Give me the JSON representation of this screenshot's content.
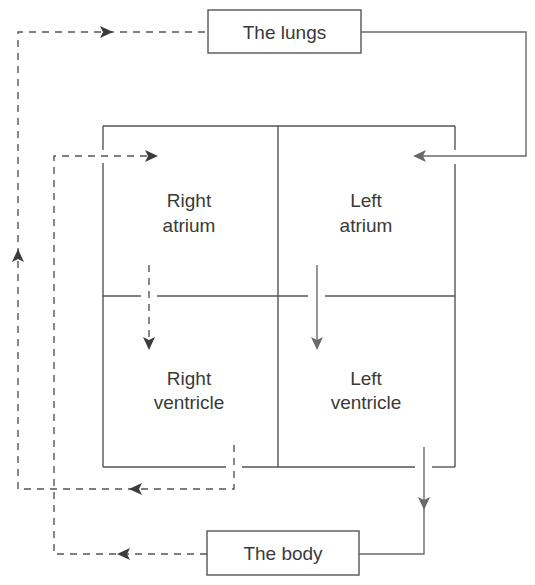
{
  "diagram": {
    "title": "",
    "nodes": {
      "lungs": {
        "label": "The lungs"
      },
      "body": {
        "label": "The body"
      },
      "right_atrium": {
        "line1": "Right",
        "line2": "atrium"
      },
      "left_atrium": {
        "line1": "Left",
        "line2": "atrium"
      },
      "right_ventricle": {
        "line1": "Right",
        "line2": "ventricle"
      },
      "left_ventricle": {
        "line1": "Left",
        "line2": "ventricle"
      }
    },
    "edges": [
      {
        "from": "body",
        "to": "right_atrium",
        "style": "dashed",
        "meaning": "deoxygenated blood"
      },
      {
        "from": "right_atrium",
        "to": "right_ventricle",
        "style": "dashed"
      },
      {
        "from": "right_ventricle",
        "to": "lungs",
        "style": "dashed"
      },
      {
        "from": "lungs",
        "to": "left_atrium",
        "style": "solid",
        "meaning": "oxygenated blood"
      },
      {
        "from": "left_atrium",
        "to": "left_ventricle",
        "style": "solid"
      },
      {
        "from": "left_ventricle",
        "to": "body",
        "style": "solid"
      }
    ],
    "colors": {
      "stroke": "#555555",
      "dashed_stroke": "#555555",
      "solid_arrow": "#6a6a6a",
      "text": "#3a3a3a"
    }
  }
}
